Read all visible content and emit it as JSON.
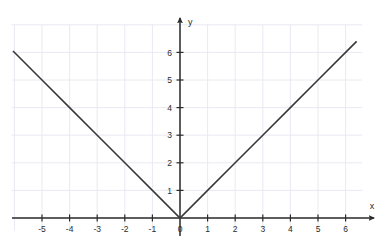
{
  "chart_data": {
    "type": "line",
    "title": "",
    "subtitle": "",
    "xlabel": "x",
    "ylabel": "y",
    "function": "y = |x|",
    "xlim": [
      -6.1,
      6.6
    ],
    "ylim": [
      -0.45,
      7.0
    ],
    "grid": true,
    "grid_step": 1,
    "legend": "none",
    "x_ticks": [
      -5,
      -4,
      -3,
      -2,
      -1,
      0,
      1,
      2,
      3,
      4,
      5,
      6
    ],
    "x_tick_labels": [
      "-5",
      "-4",
      "-3",
      "-2",
      "-1",
      "0",
      "1",
      "2",
      "3",
      "4",
      "5",
      "6"
    ],
    "y_ticks": [
      1,
      2,
      3,
      4,
      5,
      6
    ],
    "y_tick_labels": [
      "1",
      "2",
      "3",
      "4",
      "5",
      "6"
    ],
    "origin_label": "0",
    "series": [
      {
        "name": "y = |x|",
        "color": "#3a3a3a",
        "x": [
          -6.05,
          -5,
          -4,
          -3,
          -2,
          -1,
          0,
          1,
          2,
          3,
          4,
          5,
          6,
          6.4
        ],
        "values": [
          6.05,
          5,
          4,
          3,
          2,
          1,
          0,
          1,
          2,
          3,
          4,
          5,
          6,
          6.4
        ]
      }
    ],
    "annotations": [],
    "colors": {
      "line": "#3a3a3a",
      "axis": "#2b2b2b",
      "grid": "#e9e9f2",
      "background": "#ffffff",
      "text": "#2b2b2b"
    }
  },
  "axes": {
    "x_axis_name": "x",
    "y_axis_name": "y"
  }
}
